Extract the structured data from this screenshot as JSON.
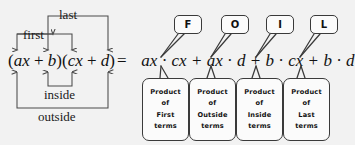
{
  "diagram": {
    "arrow_labels": {
      "first": "first",
      "last": "last",
      "inside": "inside",
      "outside": "outside"
    },
    "binomial_expression": "(ax + b)(cx + d)",
    "equals_sign": "=",
    "expansion_terms": [
      {
        "key": "F",
        "text": "ax · cx"
      },
      {
        "key": "O",
        "text": "ax · d"
      },
      {
        "key": "I",
        "text": "b · cx"
      },
      {
        "key": "L",
        "text": "b · d"
      }
    ],
    "plus_sign": "+",
    "letter_bubbles": [
      {
        "letter": "F"
      },
      {
        "letter": "O"
      },
      {
        "letter": "I"
      },
      {
        "letter": "L"
      }
    ],
    "description_boxes": [
      {
        "line1": "Product",
        "line2": "of",
        "line3": "First",
        "line4": "terms"
      },
      {
        "line1": "Product",
        "line2": "of",
        "line3": "Outside",
        "line4": "terms"
      },
      {
        "line1": "Product",
        "line2": "of",
        "line3": "Inside",
        "line4": "terms"
      },
      {
        "line1": "Product",
        "line2": "of",
        "line3": "Last",
        "line4": "terms"
      }
    ]
  },
  "colors": {
    "background": "#f2f2f2",
    "ink": "#111111",
    "line": "#4a4a4a",
    "box_fill": "#fbfbfb",
    "box_border": "#3a3a3a"
  }
}
